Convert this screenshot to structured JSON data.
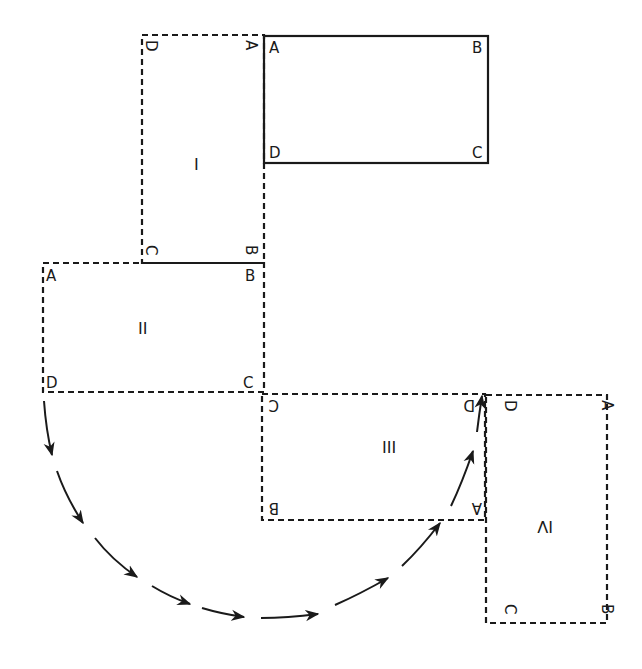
{
  "diagram": {
    "title": "",
    "original": {
      "name": "original rectangle",
      "style": "solid",
      "labels": {
        "A": "A",
        "B": "B",
        "C": "C",
        "D": "D"
      }
    },
    "positions": [
      {
        "id": "I",
        "label": "I",
        "style": "dashed",
        "corners": {
          "top_left": "D",
          "top_right": "A",
          "bottom_left": "C",
          "bottom_right": "B"
        }
      },
      {
        "id": "II",
        "label": "II",
        "style": "dashed",
        "corners": {
          "top_left": "A",
          "top_right": "B",
          "bottom_left": "D",
          "bottom_right": "C"
        }
      },
      {
        "id": "III",
        "label": "III",
        "style": "dashed",
        "corners": {
          "top_left": "C",
          "top_right": "D",
          "bottom_left": "B",
          "bottom_right": "A"
        }
      },
      {
        "id": "IV",
        "label": "IV",
        "style": "dashed",
        "corners": {
          "top_left": "D",
          "top_right": "A",
          "bottom_left": "C",
          "bottom_right": "B"
        }
      }
    ],
    "path": {
      "name": "locus of corner D",
      "from": "D (position II)",
      "to": "D (position III/IV)",
      "arrow_count": 10
    },
    "colors": {
      "ink": "#1a1a1a",
      "background": "#ffffff"
    }
  }
}
